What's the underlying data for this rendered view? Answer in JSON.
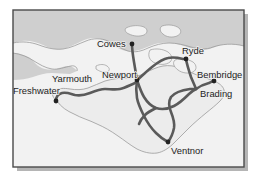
{
  "figure": {
    "name": "isle-of-wight-route-map",
    "frame": {
      "border_color": "#4a4a4a",
      "shadow_color": "#b5b5b5",
      "x": 13,
      "y": 10,
      "width": 231,
      "height": 157
    },
    "colors": {
      "sea": "#f2f2f2",
      "mainland": "#cfcfcf",
      "island": "#ececec",
      "island_outline": "#9a9a9a",
      "route": "#5a5a5a",
      "station_dot": "#222222",
      "label_text": "#1c1c1c",
      "label_halo": "#f0f0f0"
    }
  },
  "places": [
    {
      "id": "cowes",
      "label": "Cowes",
      "label_x": 97,
      "label_y": 47,
      "anchor": "start",
      "dot_x": 132,
      "dot_y": 44,
      "has_dot": true
    },
    {
      "id": "ryde",
      "label": "Ryde",
      "label_x": 182,
      "label_y": 54,
      "anchor": "start",
      "dot_x": 186,
      "dot_y": 59,
      "has_dot": true
    },
    {
      "id": "newport",
      "label": "Newport",
      "label_x": 102,
      "label_y": 78,
      "anchor": "start",
      "dot_x": 137,
      "dot_y": 80,
      "has_dot": true
    },
    {
      "id": "bembridge",
      "label": "Bembridge",
      "label_x": 197,
      "label_y": 78,
      "anchor": "start",
      "dot_x": 214,
      "dot_y": 81,
      "has_dot": true
    },
    {
      "id": "brading",
      "label": "Brading",
      "label_x": 200,
      "label_y": 97,
      "anchor": "start",
      "dot_x": 196,
      "dot_y": 88,
      "has_dot": false
    },
    {
      "id": "yarmouth",
      "label": "Yarmouth",
      "label_x": 52,
      "label_y": 82,
      "anchor": "start",
      "dot_x": 0,
      "dot_y": 0,
      "has_dot": false
    },
    {
      "id": "freshwater",
      "label": "Freshwater",
      "label_x": 13,
      "label_y": 94,
      "anchor": "start",
      "dot_x": 56,
      "dot_y": 101,
      "has_dot": true
    },
    {
      "id": "ventnor",
      "label": "Ventnor",
      "label_x": 171,
      "label_y": 154,
      "anchor": "start",
      "dot_x": 168,
      "dot_y": 142,
      "has_dot": true
    }
  ],
  "geography": {
    "mainland_path": "M 13,10 L 244,10 L 244,46 C 236,44 228,43 221,45 C 214,47 209,50 202,50 C 196,50 190,48 184,46 C 176,43 168,42 160,43 C 152,44 146,48 139,50 C 132,52 126,52 120,49 C 113,46 108,41 101,39 C 94,37 88,38 82,41 C 75,44 69,48 62,49 C 55,50 49,48 43,45 C 36,42 29,40 22,41 C 19,41 16,42 13,43 Z",
    "mainland_west_path": "M 13,53 C 19,53 25,55 30,58 C 34,61 36,65 40,67 C 45,70 51,70 56,69 C 60,68 64,66 68,66 C 72,66 75,68 77,71 L 70,74 C 64,74 58,73 52,73 C 45,73 39,75 33,77 C 27,79 20,80 13,80 Z",
    "island_path": "M 57,101 C 53,98 51,94 54,91 C 58,88 64,88 70,89 C 76,90 82,90 88,88 C 94,86 99,83 105,81 C 112,79 119,78 126,78 C 133,78 139,76 145,73 C 151,70 157,67 163,66 C 169,65 175,66 180,68 C 186,70 191,73 197,75 C 203,77 209,79 214,81 C 219,83 223,86 224,90 C 225,94 223,98 220,101 C 216,105 211,109 206,113 C 200,118 194,123 189,128 C 184,133 179,138 174,143 C 169,148 163,152 157,153 C 150,154 143,152 137,149 C 130,145 124,140 118,136 C 111,131 104,127 97,124 C 89,120 81,118 74,114 C 67,111 61,107 57,101 Z",
    "island_inner_paths": [
      "M 96,66 C 100,64 104,64 107,66 C 110,68 110,71 107,72 C 103,73 99,71 96,69 Z",
      "M 150,50 C 156,48 163,49 168,52 C 172,55 173,59 170,62 C 166,65 160,65 155,63 C 150,61 147,56 150,50 Z",
      "M 175,60 C 181,58 188,59 193,62 C 197,65 197,70 193,72 C 188,74 182,73 178,70 C 174,67 172,63 175,60 Z"
    ],
    "bay_paths": [
      "M 126,28 C 132,25 139,25 144,27 C 148,29 148,33 144,35 C 139,37 133,36 129,34 C 126,33 124,30 126,28 Z",
      "M 162,26 C 168,24 175,25 179,28 C 182,31 181,34 177,36 C 172,38 166,37 163,34 C 160,32 159,28 162,26 Z"
    ],
    "coast_lines": [
      "M 13,43 C 22,41 31,42 39,45 C 47,48 55,50 63,49 C 71,48 78,44 86,41 C 93,38 101,38 108,41 C 115,44 121,49 128,51 C 135,53 142,51 148,48 C 155,45 162,43 169,43 C 177,43 184,45 191,47 C 198,49 206,50 213,47 C 222,44 233,43 244,46",
      "M 13,53 C 21,54 28,57 34,61 C 39,64 45,68 52,69 C 58,70 65,67 71,66 C 75,65 78,68 77,71"
    ]
  },
  "routes": [
    {
      "id": "freshwater-newport",
      "from": "freshwater",
      "to": "newport",
      "path": "M 56,101 C 56,97 58,94 62,93 C 67,92 71,94 75,95 C 80,96 85,95 90,93 C 95,91 100,89 105,89 C 110,89 115,90 120,89 C 125,88 130,85 135,83 C 136,82 137,81 137,80"
    },
    {
      "id": "cowes-newport",
      "from": "cowes",
      "to": "newport",
      "path": "M 132,44 C 132,50 133,56 134,62 C 135,68 136,74 137,80"
    },
    {
      "id": "newport-ryde",
      "from": "newport",
      "to": "ryde",
      "path": "M 137,80 C 142,76 147,71 152,67 C 157,63 162,59 168,58 C 173,57 179,58 183,59 C 184,59 185,59 186,59"
    },
    {
      "id": "ryde-brading",
      "from": "ryde",
      "to": "brading",
      "path": "M 186,59 C 187,65 189,71 191,77 C 193,82 195,86 196,89"
    },
    {
      "id": "brading-bembridge",
      "from": "brading",
      "to": "bembridge",
      "path": "M 196,89 C 200,86 205,84 209,83 C 211,82 213,81 214,81"
    },
    {
      "id": "newport-sandown-loop",
      "from": "newport",
      "to": "brading",
      "path": "M 137,80 C 139,86 141,92 144,97 C 147,102 151,106 156,108 C 162,110 168,109 174,106 C 180,103 184,99 189,94 C 192,91 194,90 196,89"
    },
    {
      "id": "newport-south-branch",
      "from": "newport",
      "to": "ventnor",
      "path": "M 137,80 C 136,86 136,92 137,98 C 138,104 141,110 144,116 C 147,122 151,128 156,133 C 160,137 164,140 168,142"
    },
    {
      "id": "ventnor-brading-east",
      "from": "ventnor",
      "to": "brading",
      "path": "M 168,142 C 171,138 173,133 174,128 C 175,122 173,117 171,112 C 169,107 168,102 171,97 C 175,92 183,90 190,89 C 193,89 195,89 196,89"
    },
    {
      "id": "cross-link-mid",
      "from": "newport-loop",
      "to": "ventnor-branch",
      "path": "M 156,108 C 152,110 148,112 145,115 C 142,118 140,121 139,124"
    }
  ]
}
